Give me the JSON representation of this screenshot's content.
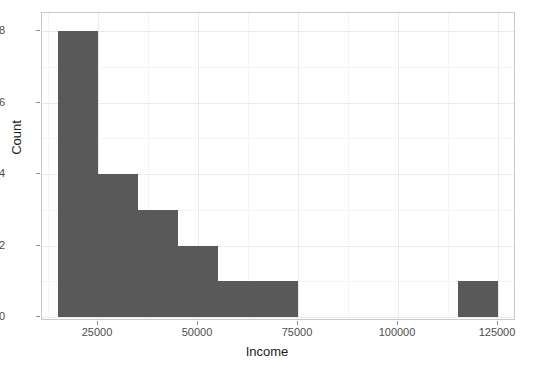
{
  "chart_data": {
    "type": "bar",
    "title": "",
    "subtitle": "",
    "xlabel": "Income",
    "ylabel": "Count",
    "xlim": [
      15000,
      131000
    ],
    "ylim": [
      0,
      8.4
    ],
    "grid": true,
    "legend": null,
    "bin_width": 10000,
    "bar_color": "#595959",
    "panel_background": "#ffffff",
    "gridline_color": "#eaeaea",
    "xticks": [
      25000,
      50000,
      75000,
      100000,
      125000
    ],
    "xtick_labels": [
      "25000",
      "50000",
      "75000",
      "100000",
      "125000"
    ],
    "yticks": [
      0,
      2,
      4,
      6,
      8
    ],
    "ytick_labels": [
      "0",
      "2",
      "4",
      "6",
      "8"
    ],
    "bins": [
      {
        "x0": 15000,
        "x1": 25000,
        "count": 8
      },
      {
        "x0": 25000,
        "x1": 35000,
        "count": 4
      },
      {
        "x0": 35000,
        "x1": 45000,
        "count": 3
      },
      {
        "x0": 45000,
        "x1": 55000,
        "count": 2
      },
      {
        "x0": 55000,
        "x1": 65000,
        "count": 1
      },
      {
        "x0": 65000,
        "x1": 75000,
        "count": 1
      },
      {
        "x0": 115000,
        "x1": 125000,
        "count": 1
      }
    ],
    "categories": [
      "15000-25000",
      "25000-35000",
      "35000-45000",
      "45000-55000",
      "55000-65000",
      "65000-75000",
      "115000-125000"
    ],
    "values": [
      8,
      4,
      3,
      2,
      1,
      1,
      1
    ]
  }
}
